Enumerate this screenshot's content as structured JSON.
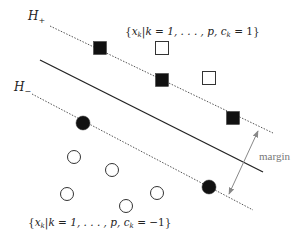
{
  "labels": {
    "h_plus": {
      "main": "H",
      "sub": "+"
    },
    "h_minus": {
      "main": "H",
      "sub": "−"
    },
    "positive_set": "{x_k | k = 1, …, p, c_k = 1}",
    "positive_set_parts": {
      "open": "{",
      "x": "x",
      "k": "k",
      "rest": "|k = 1, . . . , p, c",
      "ck": "k",
      "eq": " = 1}"
    },
    "negative_set": "{x_k | k = 1, …, p, c_k = −1}",
    "negative_set_parts": {
      "open": "{",
      "x": "x",
      "k": "k",
      "rest": "|k = 1, . . . , p, c",
      "ck": "k",
      "eq": " = −1}"
    },
    "margin": "margin"
  },
  "colors": {
    "ink": "#111111",
    "dotted": "#555555",
    "arrow": "#888888",
    "margin_text": "#777777",
    "background": "#ffffff"
  },
  "geometry": {
    "separating_line": {
      "x1": 40,
      "y1": 60,
      "x2": 263,
      "y2": 172
    },
    "h_plus_line": {
      "x1": 50,
      "y1": 26,
      "x2": 273,
      "y2": 133
    },
    "h_minus_line": {
      "x1": 32,
      "y1": 94,
      "x2": 253,
      "y2": 210
    },
    "margin_arrow": {
      "x1": 258,
      "y1": 131,
      "x2": 229,
      "y2": 194
    }
  },
  "points": {
    "positive_support_vectors": [
      {
        "x": 100,
        "y": 48
      },
      {
        "x": 162,
        "y": 80
      },
      {
        "x": 233,
        "y": 118
      }
    ],
    "positive_other": [
      {
        "x": 162,
        "y": 48
      },
      {
        "x": 209,
        "y": 78
      }
    ],
    "negative_support_vectors": [
      {
        "x": 83,
        "y": 123
      },
      {
        "x": 209,
        "y": 187
      }
    ],
    "negative_other": [
      {
        "x": 74,
        "y": 157
      },
      {
        "x": 112,
        "y": 170
      },
      {
        "x": 67,
        "y": 194
      },
      {
        "x": 126,
        "y": 206
      },
      {
        "x": 157,
        "y": 193
      }
    ]
  }
}
